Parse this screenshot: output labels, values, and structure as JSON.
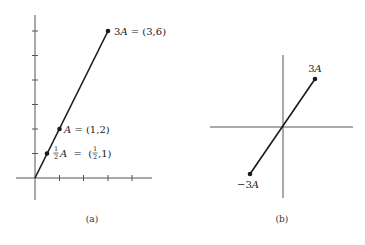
{
  "panels": {
    "a": {
      "caption": "(a)",
      "labels": {
        "three_a": {
          "coef": "3",
          "var": "A",
          "eq": " = (3,6)"
        },
        "a": {
          "var": "A",
          "eq": " = (1,2)"
        },
        "half_a": {
          "num": "1",
          "den": "2",
          "var": "A",
          "eq_open": "  =  (",
          "eq_num": "1",
          "eq_den": "2",
          "eq_close": ",1)"
        }
      },
      "x_ticks": [
        1,
        2,
        3,
        4
      ],
      "y_ticks": [
        1,
        2,
        3,
        4,
        5,
        6
      ],
      "points": [
        {
          "name": "1/2 A",
          "x": 0.5,
          "y": 1
        },
        {
          "name": "A",
          "x": 1,
          "y": 2
        },
        {
          "name": "3A",
          "x": 3,
          "y": 6
        }
      ]
    },
    "b": {
      "caption": "(b)",
      "labels": {
        "three_a": {
          "coef": "3",
          "var": "A"
        },
        "neg_three_a": {
          "coef": "−3",
          "var": "A"
        }
      },
      "points": [
        {
          "name": "3A"
        },
        {
          "name": "-3A"
        }
      ]
    }
  },
  "colors": {
    "ink": "#1a1a1a",
    "axis": "#555555",
    "background": "#ffffff"
  }
}
